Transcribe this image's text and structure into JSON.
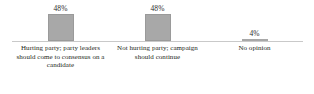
{
  "chart_data": {
    "type": "bar",
    "title": "",
    "subtitle": "",
    "xlabel": "",
    "ylabel": "",
    "ylim": [
      0,
      60
    ],
    "grid": false,
    "legend": false,
    "bar_color": "#a8a8a8",
    "axis_color": "#c9c9c9",
    "text_color": "#231f20",
    "categories": [
      "Hurting party; party leaders should come to consensus on a candidate",
      "Not hurting party; campaign should continue",
      "No opinion"
    ],
    "values": [
      48,
      48,
      4
    ],
    "value_labels": [
      "48%",
      "48%",
      "4%"
    ]
  }
}
